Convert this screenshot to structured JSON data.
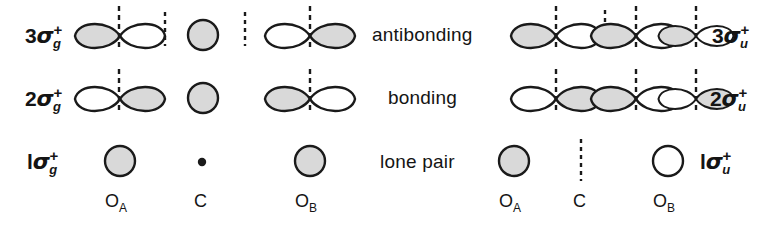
{
  "diagram": {
    "colors": {
      "stroke": "#1a1a1a",
      "shaded_lobe": "#d9d9d9",
      "empty_lobe": "#ffffff",
      "background": "#ffffff",
      "dashed": "#1a1a1a"
    }
  },
  "rows": [
    {
      "id": "antibonding",
      "center_label": "antibonding",
      "left_label": {
        "num": "3",
        "sigma": "σ",
        "sub": "g",
        "sup": "+"
      },
      "right_label": {
        "num": "3",
        "sigma": "σ",
        "sub": "u",
        "sup": "+"
      }
    },
    {
      "id": "bonding",
      "center_label": "bonding",
      "left_label": {
        "num": "2",
        "sigma": "σ",
        "sub": "g",
        "sup": "+"
      },
      "right_label": {
        "num": "2",
        "sigma": "σ",
        "sub": "u",
        "sup": "+"
      }
    },
    {
      "id": "lone-pair",
      "center_label": "lone pair",
      "left_label": {
        "num": "l",
        "sigma": "σ",
        "sub": "g",
        "sup": "+"
      },
      "right_label": {
        "num": "l",
        "sigma": "σ",
        "sub": "u",
        "sup": "+"
      }
    }
  ],
  "atom_labels": {
    "left": [
      {
        "element": "O",
        "sub": "A"
      },
      {
        "element": "C",
        "sub": ""
      },
      {
        "element": "O",
        "sub": "B"
      }
    ],
    "right": [
      {
        "element": "O",
        "sub": "A"
      },
      {
        "element": "C",
        "sub": ""
      },
      {
        "element": "O",
        "sub": "B"
      }
    ]
  },
  "orbitals": {
    "left_g": {
      "antibonding": [
        {
          "center": "O_A",
          "shape": "p-orbital",
          "left_lobe": "shaded",
          "right_lobe": "empty",
          "node_line": true
        },
        {
          "center": "C",
          "shape": "s-orbital",
          "fill": "shaded"
        },
        {
          "center": "O_B",
          "shape": "p-orbital",
          "left_lobe": "empty",
          "right_lobe": "shaded",
          "node_line": true
        }
      ],
      "bonding": [
        {
          "center": "O_A",
          "shape": "p-orbital",
          "left_lobe": "empty",
          "right_lobe": "shaded",
          "node_line": true
        },
        {
          "center": "C",
          "shape": "s-orbital",
          "fill": "shaded"
        },
        {
          "center": "O_B",
          "shape": "p-orbital",
          "left_lobe": "shaded",
          "right_lobe": "empty",
          "node_line": true
        }
      ],
      "lone_pair": [
        {
          "center": "O_A",
          "shape": "s-orbital",
          "fill": "shaded"
        },
        {
          "center": "C",
          "shape": "dot",
          "fill": "solid"
        },
        {
          "center": "O_B",
          "shape": "s-orbital",
          "fill": "shaded"
        }
      ]
    },
    "right_u": {
      "antibonding": [
        {
          "center": "O_A",
          "shape": "p-orbital",
          "left_lobe": "shaded",
          "right_lobe": "empty",
          "node_line": true
        },
        {
          "center": "C",
          "shape": "p-orbital",
          "left_lobe": "shaded",
          "right_lobe": "empty",
          "node_line": true
        },
        {
          "center": "O_B",
          "shape": "p-orbital",
          "left_lobe": "shaded",
          "right_lobe": "empty",
          "node_line": true
        }
      ],
      "bonding": [
        {
          "center": "O_A",
          "shape": "p-orbital",
          "left_lobe": "empty",
          "right_lobe": "shaded",
          "node_line": true
        },
        {
          "center": "C",
          "shape": "p-orbital",
          "left_lobe": "shaded",
          "right_lobe": "empty",
          "node_line": true
        },
        {
          "center": "O_B",
          "shape": "p-orbital",
          "left_lobe": "empty",
          "right_lobe": "shaded",
          "node_line": true
        }
      ],
      "lone_pair": [
        {
          "center": "O_A",
          "shape": "s-orbital",
          "fill": "shaded"
        },
        {
          "center": "C",
          "shape": "none",
          "node_line": true
        },
        {
          "center": "O_B",
          "shape": "s-orbital",
          "fill": "empty"
        }
      ]
    }
  },
  "separators": {
    "left_row1": [
      {
        "x": 165
      },
      {
        "x": 245
      }
    ],
    "right_row1": [
      {
        "x": 605
      }
    ],
    "right_row2": [
      {
        "x": 605
      }
    ],
    "right_row3": [
      {
        "x": 605
      }
    ]
  }
}
